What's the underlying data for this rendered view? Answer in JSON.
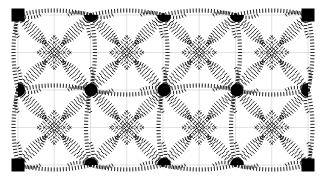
{
  "figure": {
    "width": 329,
    "height": 183,
    "background_color": "#ffffff",
    "ink_color": "#000000",
    "grid_color": "#cfcfcf",
    "domain": {
      "x_min": 18,
      "x_max": 308,
      "y_min": 15,
      "y_max": 165
    },
    "grid": {
      "columns": 4,
      "rows": 2,
      "cell_width": 72.5,
      "cell_height": 75,
      "visible": true,
      "sub_divisions": 2
    },
    "stroke_style": {
      "type": "hatched-tick-curve",
      "tick_length": 4.2,
      "tick_spacing": 3.1,
      "tick_width": 0.9
    },
    "nodes": {
      "corner_marker": "filled-square",
      "corner_size": 13,
      "edge_marker": "filled-half-disc",
      "edge_radius": 7,
      "interior_marker": "filled-disc",
      "interior_radius": 6.5,
      "corner_points": [
        {
          "id": "corner-top-left",
          "x": 18,
          "y": 15
        },
        {
          "id": "corner-top-right",
          "x": 308,
          "y": 15
        },
        {
          "id": "corner-bottom-left",
          "x": 18,
          "y": 165
        },
        {
          "id": "corner-bottom-right",
          "x": 308,
          "y": 165
        }
      ],
      "edge_points": [
        {
          "id": "edge-top-1",
          "x": 91,
          "y": 15,
          "orientation": "down"
        },
        {
          "id": "edge-top-2",
          "x": 164,
          "y": 15,
          "orientation": "down"
        },
        {
          "id": "edge-top-3",
          "x": 237,
          "y": 15,
          "orientation": "down"
        },
        {
          "id": "edge-bottom-1",
          "x": 91,
          "y": 165,
          "orientation": "up"
        },
        {
          "id": "edge-bottom-2",
          "x": 164,
          "y": 165,
          "orientation": "up"
        },
        {
          "id": "edge-bottom-3",
          "x": 237,
          "y": 165,
          "orientation": "up"
        },
        {
          "id": "edge-left-1",
          "x": 18,
          "y": 90,
          "orientation": "right"
        },
        {
          "id": "edge-right-1",
          "x": 308,
          "y": 90,
          "orientation": "left"
        }
      ],
      "interior_points": [
        {
          "id": "interior-1",
          "x": 91,
          "y": 90
        },
        {
          "id": "interior-2",
          "x": 164,
          "y": 90
        },
        {
          "id": "interior-3",
          "x": 237,
          "y": 90
        }
      ]
    }
  },
  "chart_data": {
    "type": "scatter",
    "xlabel": "",
    "ylabel": "",
    "xlim": [
      18,
      308
    ],
    "ylim": [
      15,
      165
    ],
    "grid": true,
    "legend": "none",
    "categories": [
      "corner-node",
      "edge-node",
      "interior-node"
    ],
    "series": [
      {
        "name": "corner-node",
        "marker": "square",
        "color": "#000000",
        "x": [
          18,
          308,
          18,
          308
        ],
        "y": [
          15,
          15,
          165,
          165
        ]
      },
      {
        "name": "edge-node",
        "marker": "half-disc",
        "color": "#000000",
        "x": [
          91,
          164,
          237,
          91,
          164,
          237,
          18,
          308
        ],
        "y": [
          15,
          15,
          15,
          165,
          165,
          165,
          90,
          90
        ]
      },
      {
        "name": "interior-node",
        "marker": "disc",
        "color": "#000000",
        "x": [
          91,
          164,
          237
        ],
        "y": [
          90,
          90,
          90
        ]
      }
    ],
    "annotations": [
      "Curved hatched connector bands link every node to its neighbours",
      "Each cell contains a nested diamond rosette of hatched arcs",
      "Faint gray rectangular reference grid underlies the drawing"
    ]
  }
}
